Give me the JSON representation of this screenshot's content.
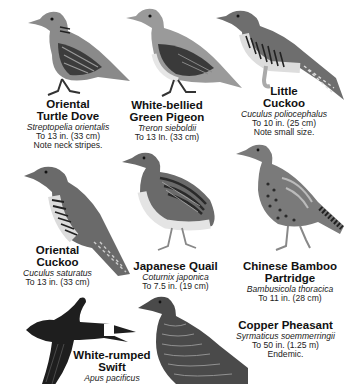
{
  "page": {
    "type": "field-guide-plate",
    "palette": {
      "background": "#ffffff",
      "text": "#111111",
      "bird_dark": "#2a2a2a",
      "bird_mid": "#7a7a7a",
      "bird_light": "#c8c8c8"
    }
  },
  "birds": [
    {
      "name_lines": [
        "Oriental",
        "Turtle Dove"
      ],
      "scientific": "Streptopelia orientalis",
      "size": "To 13 in. (33 cm)",
      "note": "Note neck stripes."
    },
    {
      "name_lines": [
        "White-bellied",
        "Green Pigeon"
      ],
      "scientific": "Treron sieboldii",
      "size": "To 13 In. (33 cm)",
      "note": ""
    },
    {
      "name_lines": [
        "Little",
        "Cuckoo"
      ],
      "scientific": "Cuculus poliocephalus",
      "size": "To 10 in. (25 cm)",
      "note": "Note small size."
    },
    {
      "name_lines": [
        "Oriental",
        "Cuckoo"
      ],
      "scientific": "Cuculus saturatus",
      "size": "To 13 in. (33 cm)",
      "note": ""
    },
    {
      "name_lines": [
        "Japanese Quail",
        ""
      ],
      "scientific": "Coturnix japonica",
      "size": "To 7.5 in. (19 cm)",
      "note": ""
    },
    {
      "name_lines": [
        "Chinese Bamboo",
        "Partridge"
      ],
      "scientific": "Bambusicola thoracica",
      "size": "To 11 in. (28 cm)",
      "note": ""
    },
    {
      "name_lines": [
        "White-rumped",
        "Swift"
      ],
      "scientific": "Apus pacificus",
      "size": "",
      "note": ""
    },
    {
      "name_lines": [
        "Copper Pheasant",
        ""
      ],
      "scientific": "Syrmaticus soemmerringii",
      "size": "To 50 in. (1.25 m)",
      "note": "Endemic."
    }
  ]
}
